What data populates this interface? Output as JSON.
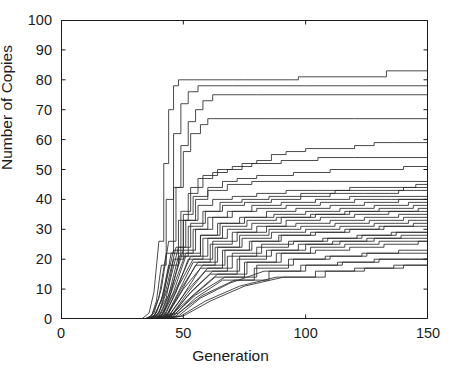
{
  "figure": {
    "background": "#ffffff",
    "line_color": "#2a2a2a",
    "axis_color": "#1b1b1b"
  },
  "chart_data": {
    "type": "line",
    "title": "",
    "subtitle": "",
    "xlabel": "Generation",
    "ylabel": "Number of Copies",
    "xlim": [
      0,
      150
    ],
    "ylim": [
      0,
      100
    ],
    "xticks": [
      0,
      50,
      100,
      150
    ],
    "yticks": [
      0,
      10,
      20,
      30,
      40,
      50,
      60,
      70,
      80,
      90,
      100
    ],
    "xtick_labels": [
      "0",
      "50",
      "100",
      "150"
    ],
    "ytick_labels": [
      "0",
      "10",
      "20",
      "30",
      "40",
      "50",
      "60",
      "70",
      "80",
      "90",
      "100"
    ],
    "grid": false,
    "legend": "none",
    "annotations": [],
    "series": [
      {
        "name": "run-01",
        "x": [
          0,
          33,
          36,
          38,
          40,
          42,
          44,
          46,
          48,
          60,
          75,
          95,
          97,
          112,
          130,
          133,
          150
        ],
        "values": [
          0,
          0,
          2,
          9,
          26,
          52,
          70,
          78,
          80,
          80,
          80,
          80,
          81,
          81,
          81,
          83,
          83
        ]
      },
      {
        "name": "run-02",
        "x": [
          0,
          34,
          37,
          39,
          41,
          43,
          46,
          49,
          52,
          56,
          70,
          100,
          125,
          150
        ],
        "values": [
          0,
          0,
          1,
          6,
          18,
          40,
          62,
          72,
          76,
          78,
          78,
          78,
          78,
          78
        ]
      },
      {
        "name": "run-03",
        "x": [
          0,
          34,
          37,
          40,
          43,
          46,
          49,
          52,
          55,
          58,
          62,
          80,
          110,
          150
        ],
        "values": [
          0,
          0,
          1,
          7,
          22,
          44,
          58,
          66,
          70,
          73,
          75,
          75,
          75,
          75
        ]
      },
      {
        "name": "run-04",
        "x": [
          0,
          35,
          38,
          41,
          44,
          47,
          50,
          53,
          57,
          60,
          85,
          120,
          150
        ],
        "values": [
          0,
          0,
          2,
          10,
          26,
          44,
          56,
          62,
          65,
          67,
          67,
          67,
          67
        ]
      },
      {
        "name": "run-05",
        "x": [
          0,
          35,
          38,
          41,
          44,
          48,
          52,
          56,
          62,
          68,
          74,
          80,
          86,
          92,
          100,
          112,
          120,
          128,
          136,
          150
        ],
        "values": [
          0,
          0,
          1,
          6,
          18,
          33,
          42,
          47,
          49,
          50,
          52,
          53,
          55,
          56,
          57,
          57,
          58,
          59,
          59,
          59
        ]
      },
      {
        "name": "run-06",
        "x": [
          0,
          35,
          38,
          42,
          45,
          49,
          53,
          58,
          64,
          70,
          78,
          90,
          105,
          120,
          150
        ],
        "values": [
          0,
          0,
          1,
          8,
          22,
          36,
          44,
          48,
          50,
          51,
          52,
          53,
          54,
          54,
          54
        ]
      },
      {
        "name": "run-07",
        "x": [
          0,
          36,
          39,
          42,
          46,
          50,
          54,
          60,
          66,
          72,
          80,
          95,
          110,
          128,
          140,
          150
        ],
        "values": [
          0,
          0,
          2,
          9,
          23,
          35,
          41,
          44,
          46,
          47,
          48,
          49,
          50,
          50,
          51,
          51
        ]
      },
      {
        "name": "run-08",
        "x": [
          0,
          36,
          39,
          43,
          46,
          50,
          55,
          60,
          68,
          78,
          90,
          105,
          125,
          150
        ],
        "values": [
          0,
          0,
          1,
          7,
          20,
          33,
          40,
          43,
          45,
          46,
          46,
          46,
          46,
          46
        ]
      },
      {
        "name": "run-09",
        "x": [
          0,
          36,
          40,
          43,
          47,
          51,
          56,
          62,
          70,
          80,
          92,
          104,
          118,
          132,
          145,
          150
        ],
        "values": [
          0,
          0,
          2,
          10,
          24,
          33,
          38,
          40,
          41,
          42,
          43,
          43,
          44,
          44,
          45,
          45
        ]
      },
      {
        "name": "run-10",
        "x": [
          0,
          36,
          40,
          44,
          48,
          52,
          58,
          65,
          74,
          85,
          98,
          112,
          126,
          140,
          150
        ],
        "values": [
          0,
          0,
          1,
          8,
          21,
          31,
          36,
          39,
          40,
          41,
          42,
          43,
          43,
          44,
          44
        ]
      },
      {
        "name": "run-11",
        "x": [
          0,
          37,
          40,
          44,
          48,
          53,
          59,
          66,
          75,
          86,
          98,
          110,
          124,
          138,
          150
        ],
        "values": [
          0,
          0,
          2,
          11,
          24,
          32,
          36,
          38,
          39,
          40,
          41,
          42,
          42,
          43,
          43
        ]
      },
      {
        "name": "run-12",
        "x": [
          0,
          37,
          41,
          45,
          49,
          54,
          60,
          68,
          78,
          90,
          104,
          118,
          132,
          150
        ],
        "values": [
          0,
          0,
          1,
          9,
          22,
          30,
          34,
          36,
          38,
          39,
          40,
          41,
          41,
          42
        ]
      },
      {
        "name": "run-13",
        "x": [
          0,
          37,
          41,
          45,
          50,
          55,
          62,
          70,
          80,
          92,
          106,
          120,
          135,
          150
        ],
        "values": [
          0,
          0,
          2,
          10,
          23,
          30,
          34,
          36,
          37,
          38,
          39,
          40,
          40,
          41
        ]
      },
      {
        "name": "run-14",
        "x": [
          0,
          37,
          41,
          46,
          51,
          57,
          64,
          73,
          84,
          96,
          110,
          124,
          138,
          150
        ],
        "values": [
          0,
          0,
          1,
          9,
          21,
          28,
          32,
          34,
          36,
          37,
          38,
          39,
          40,
          40
        ]
      },
      {
        "name": "run-15",
        "x": [
          0,
          38,
          42,
          46,
          51,
          57,
          65,
          75,
          87,
          100,
          114,
          128,
          142,
          150
        ],
        "values": [
          0,
          0,
          2,
          11,
          22,
          28,
          32,
          34,
          35,
          36,
          37,
          38,
          39,
          39
        ]
      },
      {
        "name": "run-16",
        "x": [
          0,
          38,
          42,
          47,
          52,
          58,
          66,
          76,
          88,
          102,
          116,
          130,
          144,
          150
        ],
        "values": [
          0,
          0,
          1,
          9,
          20,
          27,
          31,
          33,
          34,
          35,
          36,
          37,
          38,
          38
        ]
      },
      {
        "name": "run-17",
        "x": [
          0,
          38,
          42,
          47,
          53,
          60,
          68,
          78,
          90,
          104,
          118,
          132,
          146,
          150
        ],
        "values": [
          0,
          0,
          2,
          10,
          21,
          27,
          30,
          32,
          34,
          35,
          36,
          36,
          37,
          37
        ]
      },
      {
        "name": "run-18",
        "x": [
          0,
          38,
          43,
          48,
          54,
          61,
          70,
          80,
          92,
          106,
          120,
          134,
          150
        ],
        "values": [
          0,
          0,
          1,
          9,
          19,
          25,
          29,
          31,
          33,
          34,
          35,
          36,
          36
        ]
      },
      {
        "name": "run-19",
        "x": [
          0,
          38,
          43,
          48,
          54,
          62,
          72,
          84,
          96,
          110,
          124,
          138,
          150
        ],
        "values": [
          0,
          0,
          2,
          11,
          20,
          26,
          29,
          31,
          32,
          33,
          34,
          35,
          36
        ]
      },
      {
        "name": "run-20",
        "x": [
          0,
          39,
          43,
          49,
          55,
          63,
          73,
          85,
          98,
          112,
          126,
          140,
          150
        ],
        "values": [
          0,
          0,
          1,
          9,
          18,
          24,
          28,
          30,
          31,
          32,
          33,
          34,
          35
        ]
      },
      {
        "name": "run-21",
        "x": [
          0,
          39,
          44,
          49,
          56,
          64,
          74,
          86,
          100,
          114,
          128,
          142,
          150
        ],
        "values": [
          0,
          0,
          2,
          10,
          19,
          24,
          27,
          29,
          30,
          31,
          32,
          33,
          35
        ]
      },
      {
        "name": "run-22",
        "x": [
          0,
          39,
          44,
          50,
          57,
          66,
          77,
          89,
          102,
          116,
          130,
          144,
          150
        ],
        "values": [
          0,
          0,
          1,
          8,
          17,
          23,
          26,
          28,
          29,
          30,
          31,
          32,
          34
        ]
      },
      {
        "name": "run-23",
        "x": [
          0,
          39,
          44,
          50,
          58,
          67,
          78,
          90,
          104,
          118,
          132,
          146,
          150
        ],
        "values": [
          0,
          0,
          2,
          10,
          18,
          23,
          26,
          28,
          29,
          30,
          31,
          31,
          32
        ]
      },
      {
        "name": "run-24",
        "x": [
          0,
          39,
          45,
          51,
          59,
          68,
          80,
          93,
          107,
          121,
          135,
          150
        ],
        "values": [
          0,
          0,
          1,
          8,
          16,
          21,
          24,
          26,
          27,
          28,
          29,
          31
        ]
      },
      {
        "name": "run-25",
        "x": [
          0,
          40,
          45,
          51,
          60,
          70,
          82,
          95,
          109,
          123,
          137,
          150
        ],
        "values": [
          0,
          0,
          2,
          9,
          17,
          22,
          25,
          26,
          27,
          28,
          29,
          30
        ]
      },
      {
        "name": "run-26",
        "x": [
          0,
          40,
          45,
          52,
          61,
          72,
          84,
          97,
          111,
          125,
          139,
          150
        ],
        "values": [
          0,
          0,
          1,
          8,
          15,
          20,
          23,
          25,
          26,
          27,
          28,
          29
        ]
      },
      {
        "name": "run-27",
        "x": [
          0,
          40,
          46,
          53,
          62,
          73,
          86,
          100,
          114,
          128,
          142,
          150
        ],
        "values": [
          0,
          0,
          2,
          9,
          16,
          21,
          23,
          25,
          26,
          27,
          27,
          28
        ]
      },
      {
        "name": "run-28",
        "x": [
          0,
          40,
          46,
          53,
          63,
          75,
          88,
          102,
          116,
          130,
          144,
          150
        ],
        "values": [
          0,
          0,
          1,
          7,
          14,
          19,
          22,
          24,
          25,
          26,
          26,
          27
        ]
      },
      {
        "name": "run-29",
        "x": [
          0,
          40,
          46,
          54,
          64,
          76,
          90,
          104,
          118,
          132,
          146,
          150
        ],
        "values": [
          0,
          0,
          2,
          8,
          15,
          19,
          22,
          23,
          24,
          25,
          26,
          27
        ]
      },
      {
        "name": "run-30",
        "x": [
          0,
          41,
          47,
          55,
          66,
          79,
          93,
          108,
          123,
          138,
          150
        ],
        "values": [
          0,
          0,
          1,
          7,
          13,
          17,
          20,
          21,
          22,
          23,
          24
        ]
      },
      {
        "name": "run-31",
        "x": [
          0,
          41,
          47,
          55,
          67,
          80,
          95,
          110,
          125,
          140,
          150
        ],
        "values": [
          0,
          0,
          2,
          8,
          14,
          18,
          20,
          21,
          22,
          22,
          23
        ]
      },
      {
        "name": "run-32",
        "x": [
          0,
          41,
          48,
          57,
          69,
          83,
          98,
          113,
          128,
          143,
          150
        ],
        "values": [
          0,
          0,
          1,
          7,
          12,
          16,
          18,
          19,
          20,
          20,
          21
        ]
      },
      {
        "name": "run-33",
        "x": [
          0,
          41,
          48,
          58,
          71,
          85,
          100,
          115,
          130,
          145,
          150
        ],
        "values": [
          0,
          0,
          2,
          8,
          13,
          16,
          18,
          19,
          20,
          20,
          20
        ]
      },
      {
        "name": "run-34",
        "x": [
          0,
          42,
          49,
          59,
          73,
          88,
          104,
          120,
          136,
          150
        ],
        "values": [
          0,
          0,
          1,
          6,
          11,
          14,
          16,
          17,
          18,
          19
        ]
      },
      {
        "name": "run-35",
        "x": [
          0,
          42,
          50,
          61,
          75,
          91,
          108,
          124,
          140,
          150
        ],
        "values": [
          0,
          0,
          1,
          6,
          11,
          14,
          16,
          17,
          18,
          19
        ]
      }
    ]
  }
}
